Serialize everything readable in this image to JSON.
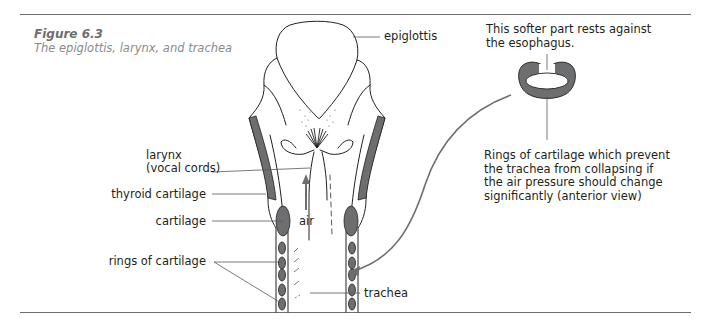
{
  "figure": {
    "number": "Figure 6.3",
    "title": "The epiglottis, larynx, and trachea"
  },
  "labels": {
    "epiglottis": "epiglottis",
    "larynx_line1": "larynx",
    "larynx_line2": "(vocal cords)",
    "thyroid_cartilage": "thyroid cartilage",
    "cartilage": "cartilage",
    "air": "air",
    "rings_of_cartilage": "rings of cartilage",
    "trachea": "trachea"
  },
  "inset": {
    "top_note_line1": "This softer part rests against",
    "top_note_line2": "the esophagus.",
    "bottom_note_lines": [
      "Rings of cartilage which prevent",
      "the trachea from collapsing if",
      "the air pressure should change",
      "significantly (anterior view)"
    ]
  },
  "colors": {
    "cartilage_fill": "#6d6e70",
    "line": "#231f20",
    "leader": "#58595b",
    "arrow": "#6d6e70",
    "caption": "#8a8b8d"
  }
}
